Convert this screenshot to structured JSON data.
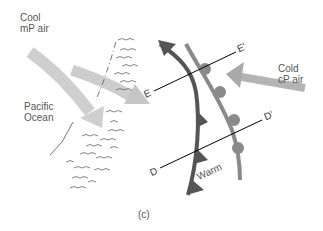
{
  "diagram": {
    "panel_label": "(c)",
    "labels": {
      "cool_air_line1": "Cool",
      "cool_air_line2": "mP air",
      "ocean_line1": "Pacific",
      "ocean_line2": "Ocean",
      "cold_air_line1": "Cold",
      "cold_air_line2": "cP air",
      "warm": "Warm"
    },
    "cross_sections": {
      "e_start": "E",
      "e_end": "E'",
      "d_start": "D",
      "d_end": "D'"
    },
    "fronts": [
      {
        "type": "cold-front",
        "symbol": "triangles",
        "color": "#555555"
      },
      {
        "type": "warm-front",
        "symbol": "semicircles",
        "color": "#8a8a8a"
      }
    ],
    "arrows": [
      {
        "name": "cool-mp-air-flow",
        "color": "#c8c8c8"
      },
      {
        "name": "second-mp-air-flow",
        "color": "#c8c8c8"
      },
      {
        "name": "cold-cp-air-flow",
        "color": "#a8a8a8"
      }
    ],
    "colors": {
      "cold_front": "#555555",
      "warm_front": "#8a8a8a",
      "arrow_light": "#c8c8c8",
      "arrow_mid": "#a9a9a9",
      "cloud_marks": "#666666"
    }
  }
}
